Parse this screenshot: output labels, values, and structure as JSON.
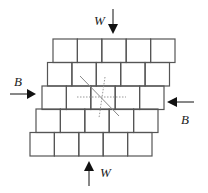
{
  "diagram": {
    "grid": {
      "rows": 5,
      "cols": 5,
      "cell_width": 24.4,
      "row_left_edges": [
        53,
        47.5,
        42,
        36,
        30
      ],
      "row_top_edges": [
        39,
        62.5,
        86,
        109,
        132.5
      ],
      "row_height": 23.5,
      "stroke_color": "#555555"
    },
    "labels": {
      "top_load": "W",
      "bottom_load": "W",
      "left_load": "B",
      "right_load": "B"
    },
    "colors": {
      "arrow": "#111111",
      "dotted": "#999999"
    }
  }
}
